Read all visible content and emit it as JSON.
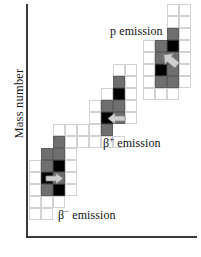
{
  "figure": {
    "type": "nuclide-decay-chart",
    "axes": {
      "y_label": "Mass number",
      "x_label": "Atomic number",
      "x_label_visible": false
    }
  },
  "labels": {
    "beta_minus": "β− emission",
    "beta_plus": "β+ emission",
    "proton": "p emission"
  },
  "colors": {
    "grid_empty_border": "#d2d2d2",
    "cell_gray": "#6f6f6f",
    "cell_dark": "#000000",
    "axis": "#3a3a3a",
    "arrow_fill": "#cfcfcf",
    "arrow_stroke": "#8a8a8a",
    "text": "#111111"
  },
  "chart_data": {
    "type": "heatmap",
    "title": "",
    "xlabel": "Atomic number",
    "ylabel": "Mass number",
    "grid": true,
    "legend_position": "inline-annotations",
    "cell_size_px": 12,
    "annotations": [
      {
        "text": "β− emission",
        "x_px": 58,
        "y_px": 208,
        "cluster": "beta-minus"
      },
      {
        "text": "β+ emission",
        "x_px": 103,
        "y_px": 136,
        "cluster": "beta-plus"
      },
      {
        "text": "p emission",
        "x_px": 110,
        "y_px": 24,
        "cluster": "proton"
      }
    ],
    "clusters": [
      {
        "name": "beta-minus",
        "label": "β− emission",
        "arrow_direction": "right",
        "arrow_x_px": 45,
        "arrow_y_px": 172,
        "cells": [
          {
            "x_px": 41,
            "y_px": 148,
            "state": "gray"
          },
          {
            "x_px": 53,
            "y_px": 136,
            "state": "gray"
          },
          {
            "x_px": 53,
            "y_px": 148,
            "state": "gray"
          },
          {
            "x_px": 41,
            "y_px": 160,
            "state": "gray"
          },
          {
            "x_px": 53,
            "y_px": 160,
            "state": "dark"
          },
          {
            "x_px": 41,
            "y_px": 172,
            "state": "dark"
          },
          {
            "x_px": 53,
            "y_px": 172,
            "state": "gray"
          },
          {
            "x_px": 41,
            "y_px": 184,
            "state": "gray"
          },
          {
            "x_px": 53,
            "y_px": 184,
            "state": "dark"
          },
          {
            "x_px": 29,
            "y_px": 160,
            "state": "empty"
          },
          {
            "x_px": 29,
            "y_px": 172,
            "state": "empty"
          },
          {
            "x_px": 29,
            "y_px": 184,
            "state": "empty"
          },
          {
            "x_px": 29,
            "y_px": 196,
            "state": "empty"
          },
          {
            "x_px": 41,
            "y_px": 196,
            "state": "empty"
          },
          {
            "x_px": 53,
            "y_px": 196,
            "state": "empty"
          },
          {
            "x_px": 29,
            "y_px": 208,
            "state": "empty"
          },
          {
            "x_px": 41,
            "y_px": 208,
            "state": "empty"
          },
          {
            "x_px": 65,
            "y_px": 136,
            "state": "empty"
          },
          {
            "x_px": 65,
            "y_px": 148,
            "state": "empty"
          },
          {
            "x_px": 65,
            "y_px": 160,
            "state": "empty"
          },
          {
            "x_px": 65,
            "y_px": 172,
            "state": "empty"
          },
          {
            "x_px": 65,
            "y_px": 184,
            "state": "empty"
          },
          {
            "x_px": 77,
            "y_px": 124,
            "state": "empty"
          },
          {
            "x_px": 77,
            "y_px": 136,
            "state": "empty"
          },
          {
            "x_px": 53,
            "y_px": 124,
            "state": "empty"
          },
          {
            "x_px": 65,
            "y_px": 124,
            "state": "empty"
          }
        ]
      },
      {
        "name": "beta-plus",
        "label": "β+ emission",
        "arrow_direction": "left",
        "arrow_x_px": 107,
        "arrow_y_px": 112,
        "cells": [
          {
            "x_px": 113,
            "y_px": 76,
            "state": "gray"
          },
          {
            "x_px": 113,
            "y_px": 88,
            "state": "dark"
          },
          {
            "x_px": 101,
            "y_px": 100,
            "state": "gray"
          },
          {
            "x_px": 113,
            "y_px": 100,
            "state": "gray"
          },
          {
            "x_px": 101,
            "y_px": 112,
            "state": "dark"
          },
          {
            "x_px": 113,
            "y_px": 112,
            "state": "gray"
          },
          {
            "x_px": 101,
            "y_px": 124,
            "state": "gray"
          },
          {
            "x_px": 89,
            "y_px": 100,
            "state": "empty"
          },
          {
            "x_px": 89,
            "y_px": 112,
            "state": "empty"
          },
          {
            "x_px": 89,
            "y_px": 124,
            "state": "empty"
          },
          {
            "x_px": 89,
            "y_px": 136,
            "state": "empty"
          },
          {
            "x_px": 101,
            "y_px": 136,
            "state": "empty"
          },
          {
            "x_px": 113,
            "y_px": 136,
            "state": "empty"
          },
          {
            "x_px": 125,
            "y_px": 76,
            "state": "empty"
          },
          {
            "x_px": 125,
            "y_px": 88,
            "state": "empty"
          },
          {
            "x_px": 125,
            "y_px": 100,
            "state": "empty"
          },
          {
            "x_px": 125,
            "y_px": 112,
            "state": "empty"
          },
          {
            "x_px": 113,
            "y_px": 64,
            "state": "empty"
          },
          {
            "x_px": 125,
            "y_px": 64,
            "state": "empty"
          },
          {
            "x_px": 101,
            "y_px": 88,
            "state": "empty"
          }
        ]
      },
      {
        "name": "proton",
        "label": "p emission",
        "arrow_direction": "down-left",
        "arrow_x_px": 161,
        "arrow_y_px": 52,
        "cells": [
          {
            "x_px": 167,
            "y_px": 28,
            "state": "gray"
          },
          {
            "x_px": 155,
            "y_px": 40,
            "state": "gray"
          },
          {
            "x_px": 167,
            "y_px": 40,
            "state": "dark"
          },
          {
            "x_px": 155,
            "y_px": 52,
            "state": "gray"
          },
          {
            "x_px": 167,
            "y_px": 52,
            "state": "gray"
          },
          {
            "x_px": 155,
            "y_px": 64,
            "state": "dark"
          },
          {
            "x_px": 167,
            "y_px": 64,
            "state": "gray"
          },
          {
            "x_px": 155,
            "y_px": 76,
            "state": "gray"
          },
          {
            "x_px": 167,
            "y_px": 76,
            "state": "gray"
          },
          {
            "x_px": 143,
            "y_px": 40,
            "state": "empty"
          },
          {
            "x_px": 143,
            "y_px": 52,
            "state": "empty"
          },
          {
            "x_px": 143,
            "y_px": 64,
            "state": "empty"
          },
          {
            "x_px": 143,
            "y_px": 76,
            "state": "empty"
          },
          {
            "x_px": 143,
            "y_px": 88,
            "state": "empty"
          },
          {
            "x_px": 155,
            "y_px": 88,
            "state": "empty"
          },
          {
            "x_px": 167,
            "y_px": 88,
            "state": "empty"
          },
          {
            "x_px": 179,
            "y_px": 4,
            "state": "empty"
          },
          {
            "x_px": 179,
            "y_px": 16,
            "state": "empty"
          },
          {
            "x_px": 179,
            "y_px": 28,
            "state": "empty"
          },
          {
            "x_px": 179,
            "y_px": 40,
            "state": "empty"
          },
          {
            "x_px": 179,
            "y_px": 52,
            "state": "empty"
          },
          {
            "x_px": 179,
            "y_px": 64,
            "state": "empty"
          },
          {
            "x_px": 179,
            "y_px": 76,
            "state": "empty"
          },
          {
            "x_px": 167,
            "y_px": 16,
            "state": "empty"
          },
          {
            "x_px": 167,
            "y_px": 4,
            "state": "empty"
          }
        ]
      }
    ]
  }
}
